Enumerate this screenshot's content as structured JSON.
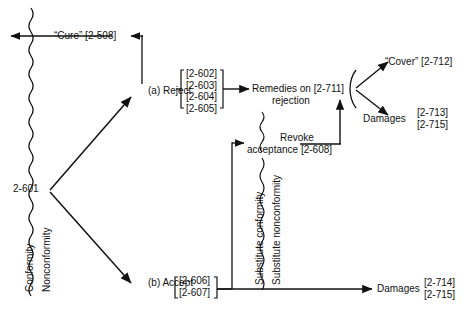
{
  "diagram": {
    "line_color": "#111111",
    "background": "#ffffff",
    "nodes": {
      "root": "2-601",
      "cure": "“Cure” [2-508]",
      "reject": "(a) Reject",
      "accept": "(b) Accept",
      "remedies_line1": "Remedies on [2-711]",
      "remedies_line2": "rejection",
      "revoke_line1": "Revoke",
      "revoke_line2": "acceptance [2-608]",
      "cover": "“Cover” [2-712]",
      "damages_upper": "Damages",
      "damages_lower": "Damages"
    },
    "citations": {
      "reject_block": [
        "[2-602]",
        "[2-603]",
        "[2-604]",
        "[2-605]"
      ],
      "accept_block": [
        "[2-606]",
        "[2-607]"
      ],
      "damages_upper_block": [
        "[2-713]",
        "[2-715]"
      ],
      "damages_lower_block": [
        "[2-714]",
        "[2-715]"
      ]
    },
    "side_labels": {
      "conformity": "Conformity",
      "nonconformity": "Nonconformity",
      "substitute_conformity": "Substitute conformity",
      "substitute_nonconformity": "Substitute nonconformity"
    }
  }
}
